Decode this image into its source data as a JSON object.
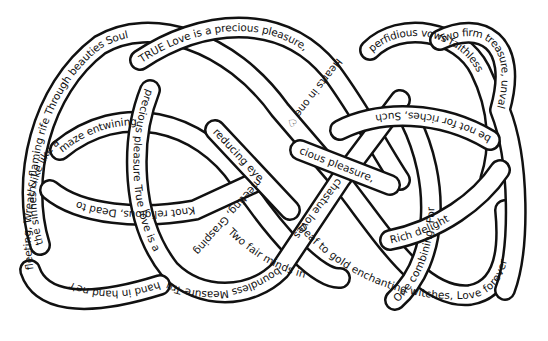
{
  "artwork": {
    "title": "Love knot poem",
    "style": "hand-drawn interlaced knot with text on ribbons",
    "colors": {
      "ink": "#111111",
      "background": "#ffffff"
    },
    "ribbons": [
      {
        "id": "top-left-arc",
        "text": "the sinnes & flaming rife Through beauties Soul"
      },
      {
        "id": "top-center",
        "text": "TRUE Love is a precious pleasure,"
      },
      {
        "id": "top-right-arc",
        "text": "perfidious vows faithless"
      },
      {
        "id": "top-right-outer",
        "text": "Two firm treasure, unvalued"
      },
      {
        "id": "left-outer",
        "text": "fleeting, Wreath like like a"
      },
      {
        "id": "left-inner-upper",
        "text": "maze entwining"
      },
      {
        "id": "left-inner-lower",
        "text": "Knot religious, Dead to"
      },
      {
        "id": "left-vertical",
        "text": "precious pleasure True love is a"
      },
      {
        "id": "bottom-left-outer",
        "text": "hand in hand ne'r"
      },
      {
        "id": "bottom-left-arc",
        "text": "boundless Measure True love is"
      },
      {
        "id": "center-diag-1",
        "text": "reducing eye"
      },
      {
        "id": "center-diag-2",
        "text": "meeting, Grasping"
      },
      {
        "id": "center-diag-3",
        "text": "Hearts in one ♡"
      },
      {
        "id": "center-diag-4",
        "text": "chastue loves"
      },
      {
        "id": "center-right",
        "text": "cious pleasure,"
      },
      {
        "id": "bottom-center",
        "text": "Two fair minds in"
      },
      {
        "id": "bottom-right-arc",
        "text": "Deaf to gold enchanting witches, Love forever"
      },
      {
        "id": "right-vertical",
        "text": "One combining, For"
      },
      {
        "id": "right-inner-upper",
        "text": "be not for riches, Such"
      },
      {
        "id": "right-inner-lower",
        "text": "Rich delight"
      }
    ]
  }
}
